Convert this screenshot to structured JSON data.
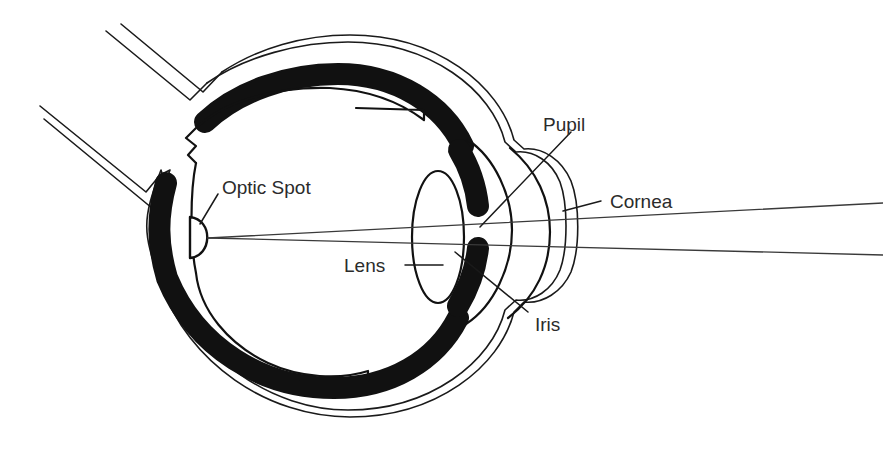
{
  "figure": {
    "background_color": "#ffffff",
    "ink_color": "#111111",
    "text_color": "#2b2b2b",
    "width": 883,
    "height": 452
  },
  "labels": {
    "optic_spot": "Optic Spot",
    "pupil": "Pupil",
    "cornea": "Cornea",
    "lens": "Lens",
    "iris": "Iris"
  },
  "parts": [
    {
      "key": "optic_spot",
      "name": "Optic Spot",
      "description": "small D-shaped photoreceptive spot on the inner rear wall"
    },
    {
      "key": "pupil",
      "name": "Pupil",
      "description": "opening between the upper and lower iris bands"
    },
    {
      "key": "cornea",
      "name": "Cornea",
      "description": "outer bulging transparent dome at the front of the eye"
    },
    {
      "key": "lens",
      "name": "Lens",
      "description": "tall narrow ellipse behind the iris"
    },
    {
      "key": "iris",
      "name": "Iris",
      "description": "dark pigmented band forming the pupil aperture"
    }
  ],
  "structures": {
    "sclera_outer": "outermost thin outline of the eyeball",
    "sclera_inner": "second thin outline inside the outer wall",
    "pigment_layer": "thick black band (choroid / pigment layer)",
    "retina": "inner thin outline with notches top and bottom",
    "optic_stalk_upper": "pair of parallel lines extending to the upper left",
    "optic_stalk_lower": "pair of parallel lines extending to the left"
  },
  "light_rays": {
    "count": 2,
    "description": "two light rays entering through the cornea and lens, converging on the optic spot",
    "converge_at": "optic_spot"
  }
}
